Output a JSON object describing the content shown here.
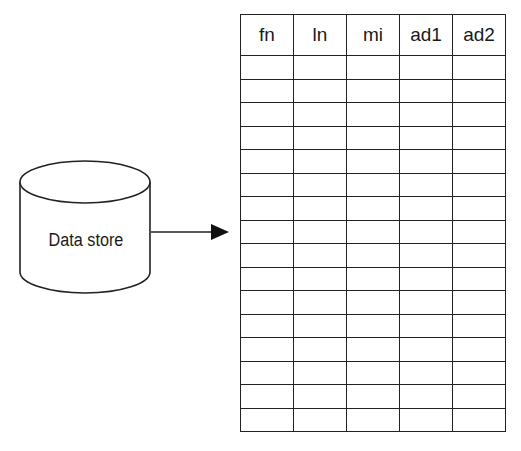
{
  "diagram": {
    "data_store": {
      "label": "Data store",
      "shape": "cylinder"
    },
    "arrow": {
      "from": "data_store",
      "to": "table",
      "direction": "right"
    },
    "table": {
      "columns": [
        "fn",
        "ln",
        "mi",
        "ad1",
        "ad2"
      ],
      "empty_row_count": 16
    }
  }
}
